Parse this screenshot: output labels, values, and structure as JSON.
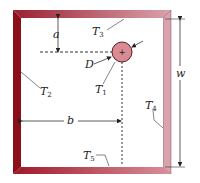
{
  "figure": {
    "type": "cross-section",
    "colors": {
      "wall_left": "#8b0f1a",
      "wall_top": "#c46a78",
      "wall_right": "#d9a3ad",
      "wall_bottom": "#c4505e",
      "cylinder_fill": "#d98a92",
      "cylinder_stroke": "#5a1a20",
      "lines": "#333333",
      "background": "#ffffff"
    },
    "labels": {
      "a": "a",
      "b": "b",
      "w": "w",
      "D": "D",
      "T1": {
        "base": "T",
        "sub": "1"
      },
      "T2": {
        "base": "T",
        "sub": "2"
      },
      "T3": {
        "base": "T",
        "sub": "3"
      },
      "T4": {
        "base": "T",
        "sub": "4"
      },
      "T5": {
        "base": "T",
        "sub": "5"
      }
    },
    "cylinder_center_mark": "+"
  }
}
